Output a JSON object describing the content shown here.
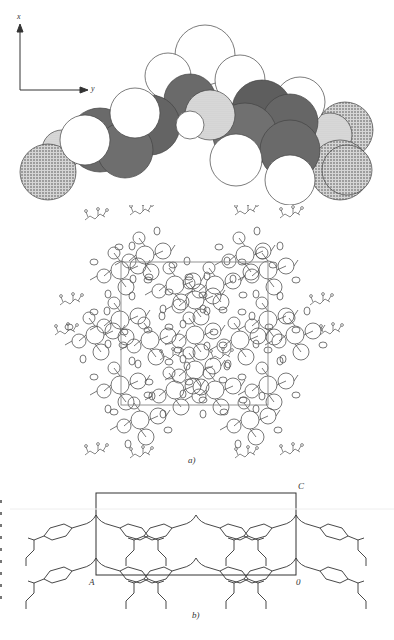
{
  "figure": {
    "top_panel": {
      "description": "Space-filling molecular model",
      "axes": {
        "vertical_label": "x",
        "horizontal_label": "y"
      },
      "fill_styles": {
        "white_atom": "#ffffff",
        "dark_atom": "#6e6e6e",
        "light_dotted_atom": "#c9c9c9",
        "dotted_atom": "#a8a8a8",
        "outline": "#444444"
      }
    },
    "panel_a": {
      "caption": "a)",
      "description": "Crystal packing diagram with unit cell outline",
      "line_color": "#555555",
      "cell_color": "#888888"
    },
    "panel_b": {
      "caption": "b)",
      "description": "Packing projection with unit cell",
      "corner_labels": {
        "top_right": "C",
        "bottom_left": "A",
        "bottom_right": "0"
      },
      "line_color": "#333333"
    }
  }
}
